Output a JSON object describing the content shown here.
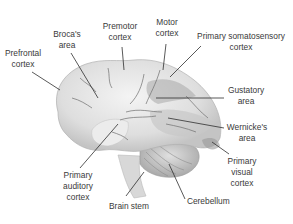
{
  "diagram": {
    "type": "labeled anatomical illustration",
    "labels": [
      {
        "id": "prefrontal",
        "text": "Prefrontal\ncortex"
      },
      {
        "id": "broca",
        "text": "Broca's\narea"
      },
      {
        "id": "premotor",
        "text": "Premotor\ncortex"
      },
      {
        "id": "motor",
        "text": "Motor\ncortex"
      },
      {
        "id": "somatosensory",
        "text": "Primary somatosensory\ncortex"
      },
      {
        "id": "gustatory",
        "text": "Gustatory\narea"
      },
      {
        "id": "wernicke",
        "text": "Wernicke's\narea"
      },
      {
        "id": "visual",
        "text": "Primary\nvisual\ncortex"
      },
      {
        "id": "cerebellum",
        "text": "Cerebellum"
      },
      {
        "id": "brainstem",
        "text": "Brain stem"
      },
      {
        "id": "auditory",
        "text": "Primary\nauditory\ncortex"
      }
    ]
  }
}
